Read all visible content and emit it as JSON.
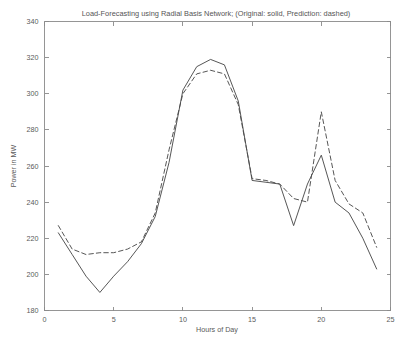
{
  "chart_data": {
    "type": "line",
    "title": "Load-Forecasting using Radial Basis Network; (Original: solid, Prediction: dashed)",
    "xlabel": "Hours of Day",
    "ylabel": "Power in MW",
    "xlim": [
      0,
      25
    ],
    "ylim": [
      180,
      340
    ],
    "xticks": [
      0,
      5,
      10,
      15,
      20,
      25
    ],
    "yticks": [
      180,
      200,
      220,
      240,
      260,
      280,
      300,
      320,
      340
    ],
    "xticklabels": [
      "0",
      "5",
      "10",
      "15",
      "20",
      "25"
    ],
    "yticklabels": [
      "180",
      "200",
      "220",
      "240",
      "260",
      "280",
      "300",
      "320",
      "340"
    ],
    "grid": false,
    "legend": "none",
    "legend_note": "Original: solid, Prediction: dashed",
    "x": [
      1,
      2,
      3,
      4,
      5,
      6,
      7,
      8,
      9,
      10,
      11,
      12,
      13,
      14,
      15,
      16,
      17,
      18,
      19,
      20,
      21,
      22,
      23,
      24
    ],
    "series": [
      {
        "name": "Original",
        "style": "solid",
        "color": "#4d4d4d",
        "values": [
          223,
          211,
          199,
          190,
          199,
          207,
          217,
          232,
          262,
          302,
          315,
          319,
          316,
          296,
          252,
          251,
          250,
          227,
          250,
          266,
          240,
          234,
          220,
          203
        ]
      },
      {
        "name": "Prediction",
        "style": "dashed",
        "color": "#4d4d4d",
        "values": [
          227,
          214,
          211,
          212,
          212,
          214,
          218,
          234,
          269,
          300,
          311,
          313,
          311,
          294,
          253,
          252,
          250,
          242,
          240,
          290,
          252,
          239,
          234,
          215
        ]
      }
    ]
  },
  "figure": {
    "background": "#ffffff",
    "axis_color": "#8a8a8a",
    "text_color": "#5a5a5a"
  }
}
